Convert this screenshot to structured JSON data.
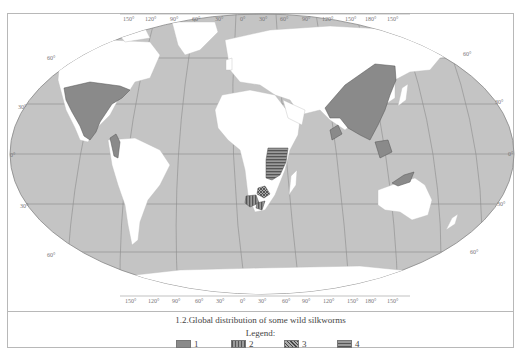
{
  "figure": {
    "caption": "1.2.Global distribution of some wild silkworms",
    "legend_title": "Legend:"
  },
  "legend": [
    {
      "label": "1",
      "pattern": "solid",
      "color": "#8a8a8a"
    },
    {
      "label": "2",
      "pattern": "vertical-stripes",
      "color": "#7a7a7a"
    },
    {
      "label": "3",
      "pattern": "crosshatch",
      "color": "#6a6a6a"
    },
    {
      "label": "4",
      "pattern": "horizontal-stripes",
      "color": "#7a7a7a"
    }
  ],
  "map": {
    "projection": "Robinson-like world map",
    "longitude_labels_top": [
      "150°",
      "120°",
      "90°",
      "60°",
      "30°",
      "0°",
      "30°",
      "60°",
      "90°",
      "120°",
      "150°",
      "180°",
      "150°"
    ],
    "longitude_labels_bottom": [
      "150°",
      "120°",
      "90°",
      "60°",
      "30°",
      "0°",
      "30°",
      "60°",
      "90°",
      "120°",
      "150°",
      "180°",
      "150°"
    ],
    "latitude_labels_left": [
      "60°",
      "30°",
      "0°",
      "30°",
      "60°"
    ],
    "latitude_labels_right": [
      "60°",
      "30°",
      "0°",
      "30°",
      "60°"
    ],
    "colors": {
      "ocean": "#c4c4c4",
      "land": "#ffffff",
      "region": "#8a8a8a",
      "grid": "#8c8c8c"
    },
    "regions": [
      {
        "name": "North and Central America (USA, Mexico)",
        "legend": "1"
      },
      {
        "name": "Northwestern South America",
        "legend": "1"
      },
      {
        "name": "East and South Asia (China, India, Southeast Asia)",
        "legend": "1"
      },
      {
        "name": "Sumatra, Borneo, New Guinea, Northern Australia",
        "legend": "1"
      },
      {
        "name": "East Africa (Tanzania, Mozambique)",
        "legend": "4"
      },
      {
        "name": "Southern Africa (Botswana, South Africa)",
        "legend": "2"
      },
      {
        "name": "Southern Africa east (Zimbabwe)",
        "legend": "3"
      }
    ]
  }
}
